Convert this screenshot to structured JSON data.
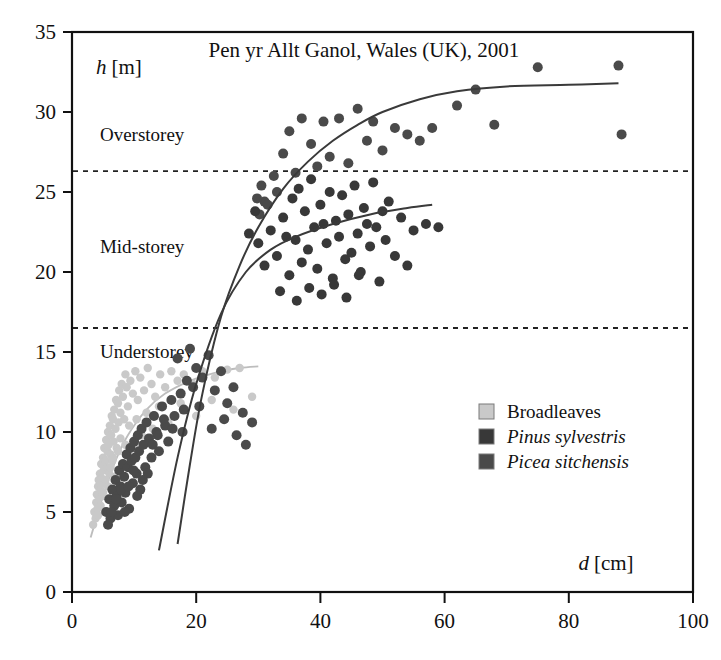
{
  "chart_data": {
    "type": "scatter",
    "title": "Pen yr Allt Ganol, Wales (UK), 2001",
    "xlabel_var": "d",
    "xlabel_unit": "[cm]",
    "ylabel_var": "h",
    "ylabel_unit": "[m]",
    "xlim": [
      0,
      100
    ],
    "ylim": [
      0,
      35
    ],
    "xticks": [
      0,
      20,
      40,
      60,
      80,
      100
    ],
    "yticks": [
      0,
      5,
      10,
      15,
      20,
      25,
      30,
      35
    ],
    "grid": false,
    "legend_position": "inside-lower-right",
    "colors": {
      "broadleaves": "#c9c9c9",
      "pinus": "#383838",
      "picea": "#4a4a4a",
      "curve": "#3a3a3a",
      "curve_light": "#bdbdbd",
      "axis": "#111111",
      "threshold": "#222222"
    },
    "annotations": [
      {
        "label": "Overstorey",
        "x": 4.5,
        "y": 28.2
      },
      {
        "label": "Mid-storey",
        "x": 4.5,
        "y": 21.2
      },
      {
        "label": "Understorey",
        "x": 4.5,
        "y": 14.6
      }
    ],
    "threshold_lines": [
      {
        "name": "overstorey-threshold",
        "y": 26.3
      },
      {
        "name": "understorey-threshold",
        "y": 16.5
      }
    ],
    "series": [
      {
        "name": "Broadleaves",
        "marker": "circle",
        "color": "#c9c9c9",
        "points": [
          [
            3.4,
            4.2
          ],
          [
            3.6,
            5.0
          ],
          [
            3.8,
            4.6
          ],
          [
            3.9,
            5.6
          ],
          [
            4.0,
            6.1
          ],
          [
            4.1,
            5.2
          ],
          [
            4.2,
            6.6
          ],
          [
            4.3,
            7.0
          ],
          [
            4.4,
            5.9
          ],
          [
            4.5,
            7.4
          ],
          [
            4.6,
            6.4
          ],
          [
            4.7,
            8.0
          ],
          [
            4.8,
            7.1
          ],
          [
            4.9,
            6.0
          ],
          [
            5.0,
            8.4
          ],
          [
            5.1,
            7.6
          ],
          [
            5.2,
            9.0
          ],
          [
            5.3,
            6.8
          ],
          [
            5.4,
            8.2
          ],
          [
            5.5,
            9.5
          ],
          [
            5.6,
            7.8
          ],
          [
            5.7,
            8.8
          ],
          [
            5.8,
            10.0
          ],
          [
            5.9,
            9.2
          ],
          [
            6.0,
            7.4
          ],
          [
            6.1,
            10.4
          ],
          [
            6.2,
            8.6
          ],
          [
            6.3,
            9.8
          ],
          [
            6.4,
            11.0
          ],
          [
            6.5,
            8.2
          ],
          [
            6.6,
            10.8
          ],
          [
            6.7,
            9.4
          ],
          [
            6.8,
            11.4
          ],
          [
            7.0,
            10.2
          ],
          [
            7.1,
            12.0
          ],
          [
            7.2,
            9.0
          ],
          [
            7.4,
            11.8
          ],
          [
            7.5,
            10.6
          ],
          [
            7.6,
            12.6
          ],
          [
            7.8,
            11.2
          ],
          [
            8.0,
            13.0
          ],
          [
            8.2,
            12.2
          ],
          [
            8.4,
            10.8
          ],
          [
            8.6,
            13.6
          ],
          [
            8.8,
            12.8
          ],
          [
            9.0,
            11.6
          ],
          [
            9.4,
            13.2
          ],
          [
            9.8,
            12.4
          ],
          [
            10.2,
            13.8
          ],
          [
            10.6,
            12.0
          ],
          [
            11.0,
            13.4
          ],
          [
            11.6,
            12.6
          ],
          [
            12.2,
            14.0
          ],
          [
            12.8,
            13.0
          ],
          [
            13.4,
            12.2
          ],
          [
            14.2,
            13.6
          ],
          [
            15.0,
            12.8
          ],
          [
            16.0,
            13.8
          ],
          [
            17.0,
            13.2
          ],
          [
            18.0,
            13.6
          ],
          [
            19.5,
            13.0
          ],
          [
            21.0,
            13.8
          ],
          [
            23.0,
            13.4
          ],
          [
            25.0,
            13.9
          ],
          [
            27.0,
            14.0
          ],
          [
            4.2,
            4.8
          ],
          [
            4.6,
            5.4
          ],
          [
            5.0,
            6.2
          ],
          [
            5.4,
            7.0
          ],
          [
            5.8,
            6.6
          ],
          [
            6.2,
            7.8
          ],
          [
            6.6,
            8.4
          ],
          [
            7.0,
            7.2
          ],
          [
            7.4,
            8.8
          ],
          [
            7.8,
            9.6
          ],
          [
            8.2,
            8.0
          ],
          [
            8.6,
            9.2
          ],
          [
            9.2,
            10.4
          ],
          [
            9.8,
            9.0
          ],
          [
            10.4,
            10.8
          ],
          [
            11.2,
            9.8
          ],
          [
            12.0,
            11.2
          ],
          [
            13.0,
            10.2
          ],
          [
            14.0,
            11.6
          ],
          [
            15.5,
            10.6
          ],
          [
            17.5,
            11.8
          ],
          [
            20.0,
            11.0
          ],
          [
            22.5,
            12.0
          ],
          [
            26.0,
            11.4
          ],
          [
            29.0,
            12.2
          ]
        ]
      },
      {
        "name": "Pinus sylvestris",
        "marker": "circle",
        "color": "#383838",
        "points": [
          [
            32.0,
            22.6
          ],
          [
            33.0,
            21.0
          ],
          [
            34.0,
            23.4
          ],
          [
            35.0,
            19.8
          ],
          [
            35.5,
            24.6
          ],
          [
            36.0,
            22.0
          ],
          [
            36.5,
            25.2
          ],
          [
            37.0,
            20.6
          ],
          [
            37.5,
            23.8
          ],
          [
            38.0,
            21.4
          ],
          [
            38.5,
            25.8
          ],
          [
            39.0,
            22.8
          ],
          [
            39.5,
            20.2
          ],
          [
            40.0,
            24.2
          ],
          [
            40.5,
            23.0
          ],
          [
            41.0,
            21.8
          ],
          [
            41.5,
            25.0
          ],
          [
            42.0,
            19.6
          ],
          [
            42.5,
            23.2
          ],
          [
            43.0,
            22.2
          ],
          [
            43.5,
            24.8
          ],
          [
            44.0,
            20.8
          ],
          [
            44.5,
            23.6
          ],
          [
            45.0,
            21.2
          ],
          [
            45.5,
            25.4
          ],
          [
            46.0,
            22.4
          ],
          [
            46.5,
            20.0
          ],
          [
            47.0,
            24.0
          ],
          [
            47.5,
            23.0
          ],
          [
            48.0,
            21.6
          ],
          [
            48.5,
            25.6
          ],
          [
            49.0,
            22.8
          ],
          [
            49.5,
            19.4
          ],
          [
            50.0,
            23.8
          ],
          [
            50.5,
            22.0
          ],
          [
            51.0,
            24.4
          ],
          [
            52.0,
            21.0
          ],
          [
            53.0,
            23.4
          ],
          [
            54.0,
            20.4
          ],
          [
            55.0,
            22.6
          ],
          [
            57.0,
            23.0
          ],
          [
            59.0,
            22.8
          ],
          [
            30.0,
            21.8
          ],
          [
            31.0,
            20.4
          ],
          [
            33.5,
            18.8
          ],
          [
            34.5,
            22.2
          ],
          [
            36.2,
            18.2
          ],
          [
            38.2,
            19.0
          ],
          [
            40.2,
            18.6
          ],
          [
            42.2,
            19.2
          ],
          [
            44.2,
            18.4
          ],
          [
            46.2,
            19.8
          ],
          [
            28.5,
            22.4
          ],
          [
            29.5,
            23.8
          ]
        ]
      },
      {
        "name": "Picea sitchensis",
        "marker": "circle",
        "color": "#4a4a4a",
        "points": [
          [
            5.5,
            5.0
          ],
          [
            6.0,
            5.8
          ],
          [
            6.2,
            4.6
          ],
          [
            6.5,
            6.4
          ],
          [
            6.8,
            5.4
          ],
          [
            7.0,
            7.0
          ],
          [
            7.2,
            6.0
          ],
          [
            7.4,
            4.8
          ],
          [
            7.6,
            7.6
          ],
          [
            7.8,
            6.6
          ],
          [
            8.0,
            5.6
          ],
          [
            8.2,
            8.0
          ],
          [
            8.4,
            7.2
          ],
          [
            8.6,
            6.2
          ],
          [
            8.8,
            8.6
          ],
          [
            9.0,
            7.8
          ],
          [
            9.2,
            5.2
          ],
          [
            9.4,
            9.0
          ],
          [
            9.6,
            8.2
          ],
          [
            9.8,
            6.8
          ],
          [
            10.0,
            9.4
          ],
          [
            10.2,
            8.4
          ],
          [
            10.4,
            7.4
          ],
          [
            10.6,
            9.8
          ],
          [
            10.8,
            8.8
          ],
          [
            11.0,
            6.4
          ],
          [
            11.2,
            10.2
          ],
          [
            11.5,
            9.2
          ],
          [
            11.8,
            7.8
          ],
          [
            12.0,
            10.6
          ],
          [
            12.4,
            9.6
          ],
          [
            12.8,
            8.4
          ],
          [
            13.2,
            11.0
          ],
          [
            13.6,
            10.0
          ],
          [
            14.0,
            8.8
          ],
          [
            14.5,
            11.6
          ],
          [
            15.0,
            10.4
          ],
          [
            15.5,
            9.4
          ],
          [
            16.0,
            12.0
          ],
          [
            16.5,
            11.0
          ],
          [
            17.0,
            14.6
          ],
          [
            17.5,
            12.4
          ],
          [
            18.0,
            11.4
          ],
          [
            18.5,
            13.2
          ],
          [
            19.0,
            15.2
          ],
          [
            19.5,
            12.8
          ],
          [
            20.0,
            14.0
          ],
          [
            21.0,
            13.4
          ],
          [
            22.0,
            14.8
          ],
          [
            23.0,
            12.6
          ],
          [
            24.0,
            13.8
          ],
          [
            25.0,
            11.8
          ],
          [
            26.0,
            12.8
          ],
          [
            27.5,
            11.2
          ],
          [
            29.0,
            10.6
          ],
          [
            5.8,
            4.2
          ],
          [
            6.4,
            5.0
          ],
          [
            7.1,
            5.8
          ],
          [
            7.9,
            6.4
          ],
          [
            8.5,
            5.0
          ],
          [
            9.1,
            6.6
          ],
          [
            9.9,
            7.6
          ],
          [
            10.5,
            6.0
          ],
          [
            11.4,
            7.0
          ],
          [
            12.2,
            7.4
          ],
          [
            13.0,
            9.2
          ],
          [
            13.8,
            9.8
          ],
          [
            14.8,
            10.8
          ],
          [
            16.2,
            10.2
          ],
          [
            17.8,
            10.0
          ],
          [
            20.5,
            11.6
          ],
          [
            22.5,
            10.2
          ],
          [
            24.5,
            10.8
          ],
          [
            26.5,
            9.8
          ],
          [
            28.0,
            9.2
          ],
          [
            31.0,
            24.4
          ],
          [
            32.5,
            26.0
          ],
          [
            34.0,
            27.4
          ],
          [
            35.0,
            28.8
          ],
          [
            36.0,
            26.2
          ],
          [
            37.0,
            29.6
          ],
          [
            38.5,
            28.0
          ],
          [
            39.5,
            26.6
          ],
          [
            40.5,
            29.4
          ],
          [
            41.5,
            27.2
          ],
          [
            43.0,
            29.6
          ],
          [
            44.5,
            26.8
          ],
          [
            46.0,
            30.2
          ],
          [
            47.5,
            28.2
          ],
          [
            48.5,
            29.4
          ],
          [
            50.0,
            27.6
          ],
          [
            52.0,
            29.0
          ],
          [
            54.0,
            28.6
          ],
          [
            56.0,
            28.2
          ],
          [
            58.0,
            29.0
          ],
          [
            62.0,
            30.4
          ],
          [
            65.0,
            31.4
          ],
          [
            68.0,
            29.2
          ],
          [
            75.0,
            32.8
          ],
          [
            88.0,
            32.9
          ],
          [
            88.5,
            28.6
          ],
          [
            30.5,
            25.4
          ],
          [
            31.5,
            24.2
          ],
          [
            33.0,
            25.0
          ],
          [
            29.8,
            24.6
          ],
          [
            30.2,
            23.6
          ]
        ]
      }
    ],
    "fit_curves": [
      {
        "name": "conifer-growth-curve",
        "color": "#3a3a3a",
        "points": [
          [
            17.0,
            3.0
          ],
          [
            19.0,
            8.0
          ],
          [
            21.0,
            12.4
          ],
          [
            24.0,
            17.2
          ],
          [
            27.0,
            20.4
          ],
          [
            30.0,
            22.8
          ],
          [
            34.0,
            25.2
          ],
          [
            38.0,
            26.9
          ],
          [
            42.0,
            28.2
          ],
          [
            46.0,
            29.2
          ],
          [
            50.0,
            30.0
          ],
          [
            56.0,
            30.8
          ],
          [
            62.0,
            31.3
          ],
          [
            70.0,
            31.6
          ],
          [
            80.0,
            31.7
          ],
          [
            88.0,
            31.8
          ]
        ]
      },
      {
        "name": "mid-storey-curve",
        "color": "#3a3a3a",
        "points": [
          [
            14.0,
            2.6
          ],
          [
            17.0,
            8.4
          ],
          [
            20.0,
            13.0
          ],
          [
            24.0,
            17.4
          ],
          [
            28.0,
            20.0
          ],
          [
            32.0,
            21.4
          ],
          [
            36.0,
            22.2
          ],
          [
            42.0,
            23.0
          ],
          [
            48.0,
            23.6
          ],
          [
            54.0,
            24.0
          ],
          [
            58.0,
            24.2
          ]
        ]
      },
      {
        "name": "broadleaves-curve",
        "color": "#bdbdbd",
        "points": [
          [
            3.0,
            3.4
          ],
          [
            5.0,
            6.0
          ],
          [
            7.0,
            8.2
          ],
          [
            9.0,
            9.8
          ],
          [
            12.0,
            11.4
          ],
          [
            15.0,
            12.4
          ],
          [
            19.0,
            13.2
          ],
          [
            23.0,
            13.7
          ],
          [
            27.0,
            14.0
          ],
          [
            30.0,
            14.1
          ]
        ]
      }
    ],
    "legend": [
      {
        "label": "Broadleaves",
        "color": "#c9c9c9",
        "italic": false
      },
      {
        "label": "Pinus sylvestris",
        "color": "#383838",
        "italic": true
      },
      {
        "label": "Picea sitchensis",
        "color": "#4a4a4a",
        "italic": true
      }
    ]
  }
}
